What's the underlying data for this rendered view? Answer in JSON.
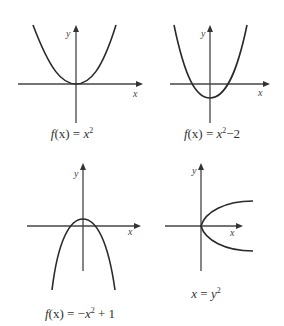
{
  "figure": {
    "panels": [
      {
        "id": "panel-1",
        "equation": "f(x) = x^2",
        "caption_parts": {
          "prefix": "f",
          "arg": "(x) = ",
          "var": "x",
          "exp": "2",
          "suffix": ""
        },
        "axis_labels": {
          "x": "x",
          "y": "y"
        },
        "shape": "upward parabola, vertex at origin"
      },
      {
        "id": "panel-2",
        "equation": "f(x) = x^2 - 2",
        "caption_parts": {
          "prefix": "f",
          "arg": "(x) = ",
          "var": "x",
          "exp": "2",
          "suffix": "−2"
        },
        "axis_labels": {
          "x": "x",
          "y": "y"
        },
        "shape": "upward parabola shifted down 2"
      },
      {
        "id": "panel-3",
        "equation": "f(x) = -x^2 + 1",
        "caption_parts": {
          "prefix": "f",
          "arg": "(x) = −",
          "var": "x",
          "exp": "2",
          "suffix": " + 1"
        },
        "axis_labels": {
          "x": "x",
          "y": "y"
        },
        "shape": "downward parabola, vertex at (0,1)"
      },
      {
        "id": "panel-4",
        "equation": "x = y^2",
        "caption_parts": {
          "prefix": "x",
          "arg": " = ",
          "var": "y",
          "exp": "2",
          "suffix": ""
        },
        "axis_labels": {
          "x": "x",
          "y": "y"
        },
        "shape": "sideways parabola opening right"
      }
    ]
  }
}
